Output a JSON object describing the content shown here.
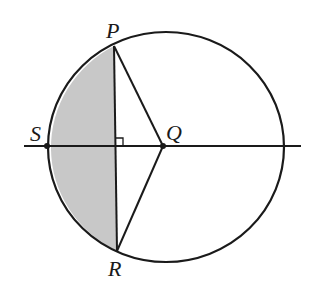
{
  "diagram": {
    "type": "geometry",
    "colors": {
      "stroke": "#1a1a1a",
      "shade": "#c8c8c8",
      "background": "#ffffff"
    },
    "points": {
      "P": {
        "label": "P",
        "x": 114,
        "y": 46
      },
      "Q": {
        "label": "Q",
        "x": 163,
        "y": 146
      },
      "R": {
        "label": "R",
        "x": 117,
        "y": 251
      },
      "S": {
        "label": "S",
        "x": 47,
        "y": 146
      }
    },
    "labels": {
      "P": "P",
      "Q": "Q",
      "R": "R",
      "S": "S"
    },
    "circle": {
      "cx": 166,
      "cy": 147,
      "rx": 118,
      "ry": 115
    },
    "line": {
      "x1": 24,
      "y1": 146,
      "x2": 301,
      "y2": 146
    },
    "right_angle_marker": {
      "at": "foot of PR on SQ",
      "x": 115,
      "y": 146,
      "size": 8
    },
    "shaded_region": "segment bounded by arc PSR and chord PR"
  }
}
